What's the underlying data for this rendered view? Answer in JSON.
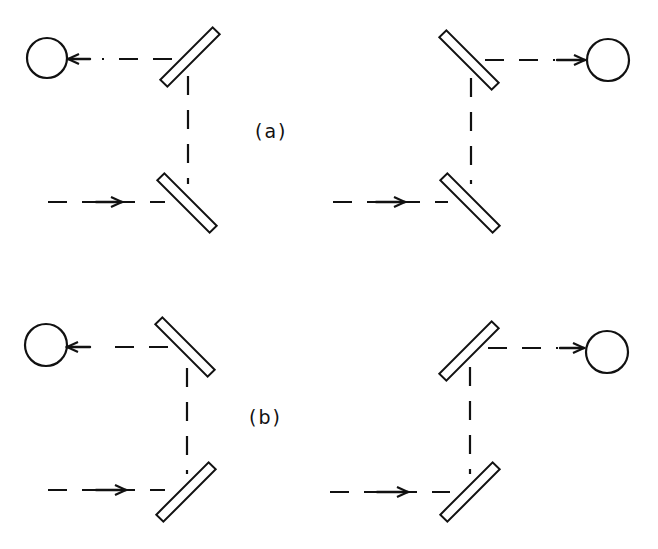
{
  "figure": {
    "panels": [
      {
        "id": "a",
        "label": "(a)",
        "description": "Two-mirror periscope configurations with parallel mirror pairs; left variant reflects beam to detector on left, right variant to detector on right"
      },
      {
        "id": "b",
        "label": "(b)",
        "description": "Two-mirror periscope configurations with crossed mirror pairs; left variant reflects beam to detector on left, right variant to detector on right"
      }
    ],
    "elements": {
      "detector": "circle",
      "mirror": "rectangle",
      "beam": "dashed line with arrow"
    },
    "colors": {
      "stroke": "#111111",
      "background": "#ffffff"
    }
  }
}
